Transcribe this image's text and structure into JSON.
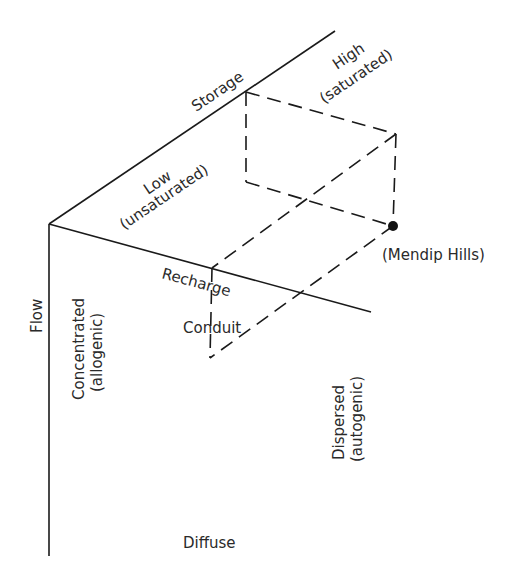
{
  "diagram": {
    "axes": {
      "storage": {
        "label": "Storage",
        "low": "Low",
        "low_sub": "(unsaturated)",
        "high": "High",
        "high_sub": "(saturated)"
      },
      "recharge": {
        "label": "Recharge",
        "concentrated": "Concentrated",
        "concentrated_sub": "(allogenic)",
        "dispersed": "Dispersed",
        "dispersed_sub": "(autogenic)"
      },
      "flow": {
        "label": "Flow",
        "conduit": "Conduit",
        "diffuse": "Diffuse"
      }
    },
    "point": {
      "label": "(Mendip Hills)"
    },
    "colors": {
      "line": "#1a1a1a",
      "text": "#2a2a2a"
    }
  }
}
